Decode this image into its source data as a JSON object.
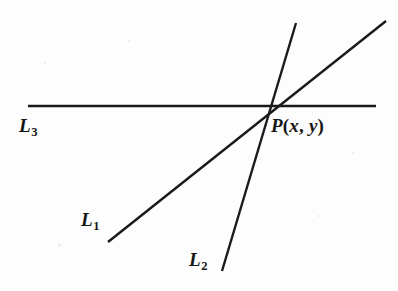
{
  "figure": {
    "background_color": "#fdfdfd",
    "stroke_color": "#1a1a1a",
    "label_color": "#161616",
    "width": 398,
    "height": 291
  },
  "lines": [
    {
      "id": "L1",
      "label_base": "L",
      "label_sub": "1",
      "description": "Oblique line rising from lower-left to upper-right through P",
      "x1": 108,
      "y1": 242,
      "x2": 386,
      "y2": 21,
      "label_x": 81,
      "label_y": 210
    },
    {
      "id": "L2",
      "label_base": "L",
      "label_sub": "2",
      "description": "Steep line rising from bottom to top through P",
      "x1": 222,
      "y1": 271,
      "x2": 296,
      "y2": 23,
      "label_x": 189,
      "label_y": 250
    },
    {
      "id": "L3",
      "label_base": "L",
      "label_sub": "3",
      "description": "Horizontal line crossing the figure through P",
      "x1": 28,
      "y1": 106,
      "x2": 376,
      "y2": 106,
      "label_x": 19,
      "label_y": 116
    }
  ],
  "point": {
    "id": "P",
    "label_base": "P",
    "open_paren": "(",
    "coord_x": "x",
    "comma": ", ",
    "coord_y": "y",
    "close_paren": ")",
    "full_label": "P(x, y)",
    "x": 266,
    "y": 107,
    "label_x": 271,
    "label_y": 116
  },
  "specks": [
    {
      "x": 44,
      "y": 62,
      "size": 2
    },
    {
      "x": 58,
      "y": 244,
      "size": 3
    },
    {
      "x": 318,
      "y": 215,
      "size": 2
    },
    {
      "x": 352,
      "y": 152,
      "size": 2
    },
    {
      "x": 128,
      "y": 40,
      "size": 2
    }
  ]
}
